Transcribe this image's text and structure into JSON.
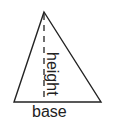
{
  "diagram": {
    "shape": "triangle",
    "labels": {
      "base": "base",
      "height": "height"
    },
    "colors": {
      "stroke": "#222222",
      "background": "#ffffff"
    }
  }
}
